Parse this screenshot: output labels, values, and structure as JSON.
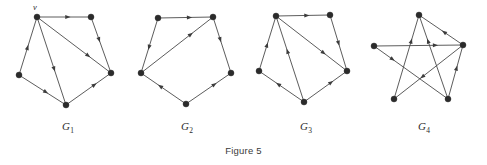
{
  "figure": {
    "caption": "Figure 5",
    "background_color": "#ffffff",
    "edge_color": "#4a4a4a",
    "vertex_color": "#2b2b2b"
  },
  "graphs": [
    {
      "id": "G1",
      "label": "G",
      "subscript": "1",
      "label_x": 62,
      "label_y": 120,
      "vertex_labels": [
        {
          "text": "v",
          "x": 33,
          "y": 2
        }
      ],
      "vertices": [
        {
          "name": "top-left",
          "x": 37,
          "y": 17
        },
        {
          "name": "top-right",
          "x": 91,
          "y": 17
        },
        {
          "name": "left",
          "x": 19,
          "y": 75
        },
        {
          "name": "right",
          "x": 111,
          "y": 73
        },
        {
          "name": "bottom",
          "x": 66,
          "y": 105
        }
      ],
      "edges": [
        {
          "from": "top-left",
          "to": "top-right",
          "arrow_at": 0.62
        },
        {
          "from": "top-right",
          "to": "right",
          "arrow_at": 0.45
        },
        {
          "from": "top-left",
          "to": "right",
          "arrow_at": 0.72
        },
        {
          "from": "left",
          "to": "top-left",
          "arrow_at": 0.52
        },
        {
          "from": "left",
          "to": "bottom",
          "arrow_at": 0.62
        },
        {
          "from": "top-left",
          "to": "bottom",
          "arrow_at": 0.62
        },
        {
          "from": "bottom",
          "to": "right",
          "arrow_at": 0.68
        }
      ]
    },
    {
      "id": "G2",
      "label": "G",
      "subscript": "2",
      "label_x": 181,
      "label_y": 120,
      "vertex_labels": [],
      "vertices": [
        {
          "name": "top-left",
          "x": 158,
          "y": 18
        },
        {
          "name": "top-right",
          "x": 213,
          "y": 17
        },
        {
          "name": "left",
          "x": 141,
          "y": 73
        },
        {
          "name": "right",
          "x": 231,
          "y": 73
        },
        {
          "name": "bottom",
          "x": 186,
          "y": 104
        }
      ],
      "edges": [
        {
          "from": "top-left",
          "to": "top-right",
          "arrow_at": 0.62
        },
        {
          "from": "top-right",
          "to": "right",
          "arrow_at": 0.45
        },
        {
          "from": "left",
          "to": "top-right",
          "arrow_at": 0.72
        },
        {
          "from": "top-left",
          "to": "left",
          "arrow_at": 0.58
        },
        {
          "from": "bottom",
          "to": "left",
          "arrow_at": 0.62
        },
        {
          "from": "bottom",
          "to": "right",
          "arrow_at": 0.68
        }
      ]
    },
    {
      "id": "G3",
      "label": "G",
      "subscript": "3",
      "label_x": 300,
      "label_y": 120,
      "vertex_labels": [],
      "vertices": [
        {
          "name": "top-left",
          "x": 276,
          "y": 16
        },
        {
          "name": "top-right",
          "x": 330,
          "y": 15
        },
        {
          "name": "left",
          "x": 259,
          "y": 71
        },
        {
          "name": "right",
          "x": 347,
          "y": 71
        },
        {
          "name": "bottom",
          "x": 304,
          "y": 102
        }
      ],
      "edges": [
        {
          "from": "top-left",
          "to": "top-right",
          "arrow_at": 0.62
        },
        {
          "from": "top-right",
          "to": "right",
          "arrow_at": 0.55
        },
        {
          "from": "top-left",
          "to": "right",
          "arrow_at": 0.7
        },
        {
          "from": "left",
          "to": "top-left",
          "arrow_at": 0.52
        },
        {
          "from": "bottom",
          "to": "left",
          "arrow_at": 0.62
        },
        {
          "from": "bottom",
          "to": "top-left",
          "arrow_at": 0.62
        },
        {
          "from": "bottom",
          "to": "right",
          "arrow_at": 0.68
        }
      ]
    },
    {
      "id": "G4",
      "label": "G",
      "subscript": "4",
      "label_x": 418,
      "label_y": 120,
      "vertex_labels": [],
      "vertices": [
        {
          "name": "top",
          "x": 419,
          "y": 15
        },
        {
          "name": "left",
          "x": 374,
          "y": 46
        },
        {
          "name": "right",
          "x": 463,
          "y": 45
        },
        {
          "name": "bottom-left",
          "x": 394,
          "y": 99
        },
        {
          "name": "bottom-right",
          "x": 448,
          "y": 99
        }
      ],
      "edges": [
        {
          "from": "left",
          "to": "right",
          "arrow_at": 0.72
        },
        {
          "from": "right",
          "to": "top",
          "arrow_at": 0.48
        },
        {
          "from": "bottom-left",
          "to": "top",
          "arrow_at": 0.72
        },
        {
          "from": "bottom-right",
          "to": "top",
          "arrow_at": 0.72
        },
        {
          "from": "left",
          "to": "bottom-right",
          "arrow_at": 0.28
        },
        {
          "from": "right",
          "to": "bottom-left",
          "arrow_at": 0.62
        },
        {
          "from": "bottom-right",
          "to": "right",
          "arrow_at": 0.62
        }
      ]
    }
  ]
}
